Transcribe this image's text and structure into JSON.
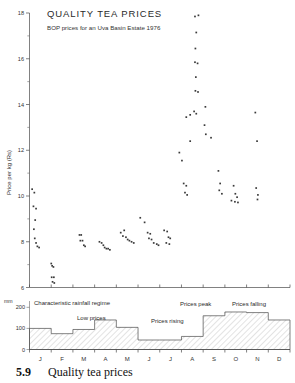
{
  "figure": {
    "title": "QUALITY TEA PRICES",
    "subtitle": "BOP prices for an Uva Basin Estate 1976",
    "caption_number": "5.9",
    "caption_text": "Quality tea prices"
  },
  "chart_data": {
    "type": "scatter",
    "title": "QUALITY TEA PRICES",
    "subtitle": "BOP prices for an Uva Basin Estate 1976",
    "xlabel": "",
    "ylabel": "Price per kg (Rs)",
    "ylim": [
      6,
      18
    ],
    "yticks": [
      6,
      8,
      10,
      12,
      14,
      16,
      18
    ],
    "xticks": [
      "J",
      "F",
      "M",
      "A",
      "M",
      "J",
      "J",
      "A",
      "S",
      "O",
      "N",
      "D"
    ],
    "xlim": [
      0,
      12
    ],
    "grid": false,
    "legend": "none",
    "points": [
      [
        0.12,
        10.3
      ],
      [
        0.22,
        10.15
      ],
      [
        0.18,
        9.55
      ],
      [
        0.3,
        9.45
      ],
      [
        0.26,
        8.95
      ],
      [
        0.2,
        8.55
      ],
      [
        0.24,
        8.15
      ],
      [
        0.3,
        7.95
      ],
      [
        0.36,
        7.8
      ],
      [
        0.44,
        7.75
      ],
      [
        1.0,
        7.05
      ],
      [
        1.04,
        6.95
      ],
      [
        1.1,
        6.9
      ],
      [
        1.02,
        6.45
      ],
      [
        1.12,
        6.45
      ],
      [
        1.06,
        6.25
      ],
      [
        1.14,
        6.2
      ],
      [
        2.3,
        8.3
      ],
      [
        2.38,
        8.3
      ],
      [
        2.34,
        8.05
      ],
      [
        2.44,
        8.05
      ],
      [
        2.5,
        7.85
      ],
      [
        2.56,
        7.8
      ],
      [
        3.22,
        8.0
      ],
      [
        3.32,
        7.95
      ],
      [
        3.4,
        7.85
      ],
      [
        3.46,
        7.75
      ],
      [
        3.54,
        7.7
      ],
      [
        3.62,
        7.7
      ],
      [
        3.7,
        7.65
      ],
      [
        4.2,
        8.4
      ],
      [
        4.36,
        8.5
      ],
      [
        4.3,
        8.25
      ],
      [
        4.44,
        8.2
      ],
      [
        4.52,
        8.1
      ],
      [
        4.6,
        8.05
      ],
      [
        4.7,
        8.0
      ],
      [
        4.8,
        7.95
      ],
      [
        5.1,
        9.05
      ],
      [
        5.3,
        8.85
      ],
      [
        5.44,
        8.4
      ],
      [
        5.56,
        8.35
      ],
      [
        5.5,
        8.15
      ],
      [
        5.62,
        8.1
      ],
      [
        5.72,
        7.95
      ],
      [
        5.86,
        7.9
      ],
      [
        5.94,
        7.85
      ],
      [
        6.2,
        8.5
      ],
      [
        6.34,
        8.45
      ],
      [
        6.4,
        8.2
      ],
      [
        6.48,
        8.15
      ],
      [
        6.3,
        7.95
      ],
      [
        6.44,
        7.9
      ],
      [
        6.9,
        11.9
      ],
      [
        7.02,
        11.55
      ],
      [
        7.1,
        10.55
      ],
      [
        7.22,
        10.45
      ],
      [
        7.16,
        10.15
      ],
      [
        7.26,
        10.05
      ],
      [
        7.4,
        12.4
      ],
      [
        7.62,
        17.85
      ],
      [
        7.78,
        17.9
      ],
      [
        7.68,
        17.15
      ],
      [
        7.64,
        16.45
      ],
      [
        7.62,
        15.85
      ],
      [
        7.74,
        15.8
      ],
      [
        7.66,
        15.2
      ],
      [
        7.64,
        14.6
      ],
      [
        7.76,
        14.55
      ],
      [
        7.58,
        13.7
      ],
      [
        7.68,
        13.6
      ],
      [
        7.4,
        13.55
      ],
      [
        7.22,
        13.45
      ],
      [
        8.1,
        13.9
      ],
      [
        8.06,
        13.1
      ],
      [
        8.12,
        12.7
      ],
      [
        8.36,
        12.55
      ],
      [
        8.7,
        11.1
      ],
      [
        8.78,
        10.55
      ],
      [
        8.74,
        10.25
      ],
      [
        8.86,
        10.1
      ],
      [
        9.4,
        10.45
      ],
      [
        9.48,
        10.1
      ],
      [
        9.56,
        9.95
      ],
      [
        9.3,
        9.8
      ],
      [
        9.46,
        9.75
      ],
      [
        9.6,
        9.72
      ],
      [
        10.4,
        13.65
      ],
      [
        10.48,
        12.4
      ],
      [
        10.44,
        10.35
      ],
      [
        10.52,
        10.05
      ],
      [
        10.5,
        9.85
      ]
    ]
  },
  "rainfall_panel": {
    "unit": "mm",
    "yticks": [
      0,
      100,
      200
    ],
    "caption": "Characteristic rainfall regime",
    "categories": [
      "J",
      "F",
      "M",
      "A",
      "M",
      "J",
      "J",
      "A",
      "S",
      "O",
      "N",
      "D"
    ],
    "values": [
      100,
      75,
      95,
      140,
      105,
      45,
      45,
      62,
      160,
      178,
      175,
      140
    ],
    "annotations": [
      {
        "label": "Characteristic rainfall regime"
      },
      {
        "label": "Low prices"
      },
      {
        "label": "Prices rising"
      },
      {
        "label": "Prices peak"
      },
      {
        "label": "Prices falling"
      }
    ]
  }
}
